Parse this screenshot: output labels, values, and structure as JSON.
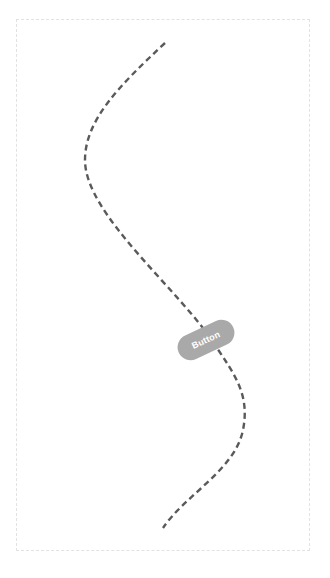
{
  "diagram": {
    "frame": {
      "border_color": "#e2e2e2",
      "style": "dashed"
    },
    "path": {
      "stroke_color": "#5a5a5a",
      "style": "dashed",
      "points": [
        [
          165,
          43
        ],
        [
          85,
          160
        ],
        [
          215,
          345
        ],
        [
          243,
          410
        ],
        [
          163,
          528
        ]
      ]
    },
    "button": {
      "label": "Button",
      "fill_color": "#a9a9a9",
      "text_color": "#ffffff",
      "rotation_deg": -25
    },
    "caption": {
      "text": ""
    }
  }
}
